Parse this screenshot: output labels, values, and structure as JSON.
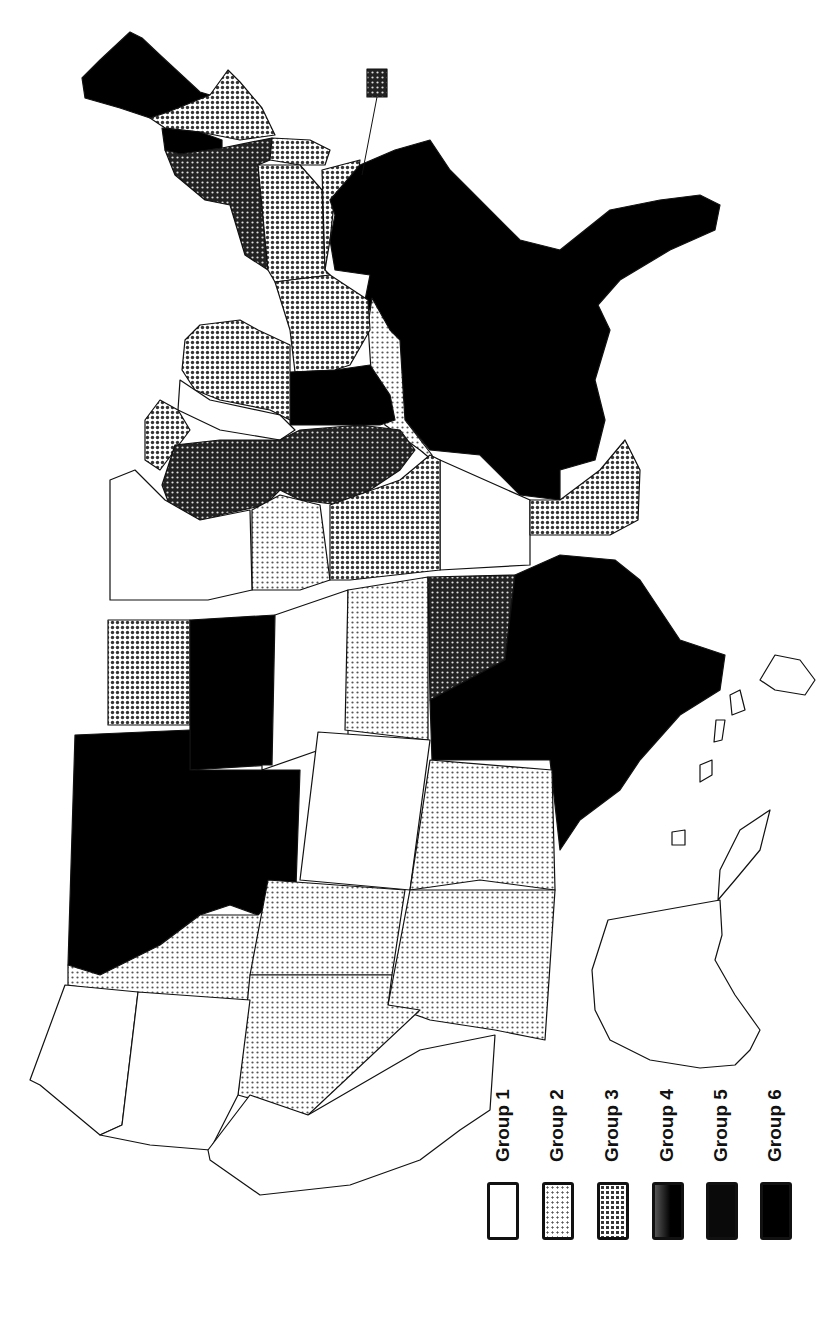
{
  "map": {
    "type": "choropleth",
    "subject": "United States by state (rotated 90°, north to the left)",
    "orientation": "rotated-90-ccw",
    "inset": {
      "label": "",
      "group": 4,
      "note": "callout box with leader line pointing to a small northeastern state"
    }
  },
  "legend": {
    "items": [
      {
        "label": "Group 1",
        "group": 1,
        "fill": "#ffffff",
        "pattern": "none"
      },
      {
        "label": "Group 2",
        "group": 2,
        "fill": "#e2e2e2",
        "pattern": "fine-dot"
      },
      {
        "label": "Group 3",
        "group": 3,
        "fill": "#bdbdbd",
        "pattern": "medium-dot"
      },
      {
        "label": "Group 4",
        "group": 4,
        "fill": "#6e6e6e",
        "pattern": "dense-dot"
      },
      {
        "label": "Group 5",
        "group": 5,
        "fill": "#0a0a0a",
        "pattern": "solid"
      },
      {
        "label": "Group 6",
        "group": 6,
        "fill": "#000000",
        "pattern": "solid"
      }
    ]
  },
  "colors": {
    "background": "#ffffff",
    "outline": "#111111",
    "group1": "#ffffff",
    "group2": "#e2e2e2",
    "group3": "#bdbdbd",
    "group4": "#6e6e6e",
    "group5": "#0a0a0a",
    "group6": "#000000"
  }
}
